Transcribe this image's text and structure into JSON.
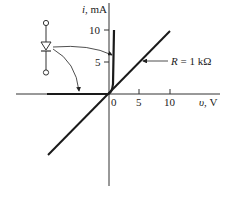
{
  "diagram": {
    "y_axis": {
      "label_var": "i",
      "label_unit": ", mA",
      "ticks": [
        "5",
        "10"
      ]
    },
    "x_axis": {
      "label_var": "υ",
      "label_unit": ", V",
      "ticks": [
        "0",
        "5",
        "10"
      ]
    },
    "resistor_label": {
      "var": "R",
      "value": " = 1 kΩ"
    },
    "icons": {
      "diode": "diode-symbol-icon"
    },
    "colors": {
      "line": "#1a1a1a",
      "axis": "#333333",
      "background": "#ffffff"
    }
  }
}
